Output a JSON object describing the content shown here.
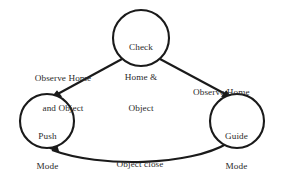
{
  "diagram": {
    "type": "state-transition-diagram",
    "background_color": "#ffffff",
    "stroke_color": "#1a1a1a",
    "text_color": "#2b2b2b",
    "nodes": [
      {
        "id": "check-home-object",
        "label_lines": [
          "Check",
          "Home &",
          "Object"
        ],
        "label": "Check Home & Object",
        "shape": "circle",
        "cx": 141,
        "cy": 38,
        "r": 28
      },
      {
        "id": "push-mode",
        "label_lines": [
          "Push",
          "Mode"
        ],
        "label": "Push Mode",
        "shape": "circle",
        "cx": 47,
        "cy": 121,
        "r": 27
      },
      {
        "id": "guide-mode",
        "label_lines": [
          "Guide",
          "Mode"
        ],
        "label": "Guide Mode",
        "shape": "circle",
        "cx": 237,
        "cy": 121,
        "r": 27
      }
    ],
    "edges": [
      {
        "id": "edge-check-to-push",
        "from": "check-home-object",
        "to": "push-mode",
        "label_lines": [
          "Observe Home",
          "and Object"
        ],
        "label": "Observe Home and Object",
        "arrow": "to"
      },
      {
        "id": "edge-check-to-guide",
        "from": "check-home-object",
        "to": "guide-mode",
        "label_lines": [
          "Observe Home"
        ],
        "label": "Observe Home",
        "arrow": "to"
      },
      {
        "id": "edge-guide-to-push",
        "from": "guide-mode",
        "to": "push-mode",
        "label_lines": [
          "Object close",
          "to the guide"
        ],
        "label": "Object close to the guide",
        "arrow": "to"
      }
    ]
  }
}
